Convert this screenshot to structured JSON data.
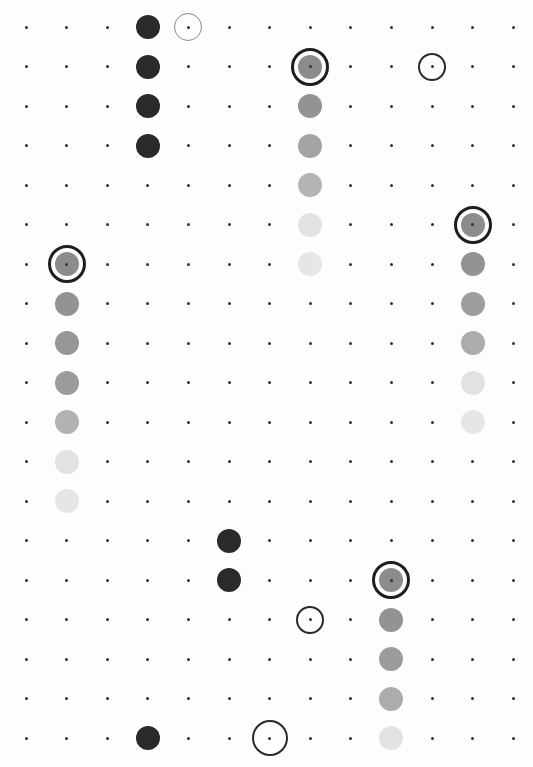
{
  "game": {
    "title": "Dot grid board",
    "grid": {
      "cols": 13,
      "rows": 19,
      "origin_x": 26,
      "origin_y": 27,
      "spacing_x": 40.6,
      "spacing_y": 39.5
    },
    "colors": {
      "dot": "#333333",
      "dark_piece": "#2a2a2a",
      "head_piece": "#8c8c8c",
      "body_1": "#939393",
      "body_2": "#9c9c9c",
      "body_3": "#b2b2b2",
      "tail_light": "#e3e3e3",
      "ring_dark": "#1e1e1e",
      "ring_grey": "#8a8a8a"
    },
    "dark_pieces": [
      {
        "col": 3,
        "row": 0
      },
      {
        "col": 3,
        "row": 1
      },
      {
        "col": 3,
        "row": 2
      },
      {
        "col": 3,
        "row": 3
      },
      {
        "col": 5,
        "row": 13
      },
      {
        "col": 5,
        "row": 14
      },
      {
        "col": 3,
        "row": 18
      }
    ],
    "snakes": [
      {
        "name": "snake-top-middle",
        "col": 7,
        "head_row": 1,
        "segments": [
          "#8c8c8c",
          "#939393",
          "#a4a4a4",
          "#b4b4b4",
          "#e2e2e2",
          "#e6e6e6"
        ]
      },
      {
        "name": "snake-right",
        "col": 11,
        "head_row": 5,
        "segments": [
          "#8c8c8c",
          "#939393",
          "#9e9e9e",
          "#acacac",
          "#e2e2e2",
          "#e6e6e6"
        ]
      },
      {
        "name": "snake-left",
        "col": 1,
        "head_row": 6,
        "segments": [
          "#8c8c8c",
          "#939393",
          "#969696",
          "#9c9c9c",
          "#b2b2b2",
          "#e2e2e2",
          "#e6e6e6"
        ]
      },
      {
        "name": "snake-bottom",
        "col": 9,
        "head_row": 14,
        "segments": [
          "#8c8c8c",
          "#939393",
          "#9c9c9c",
          "#acacac",
          "#e2e2e2"
        ]
      }
    ],
    "target_rings": [
      {
        "col": 4,
        "row": 0,
        "style": "grey"
      },
      {
        "col": 10,
        "row": 1,
        "style": "dark"
      },
      {
        "col": 7,
        "row": 15,
        "style": "dark"
      },
      {
        "col": 6,
        "row": 18,
        "style": "dark-large"
      }
    ]
  }
}
